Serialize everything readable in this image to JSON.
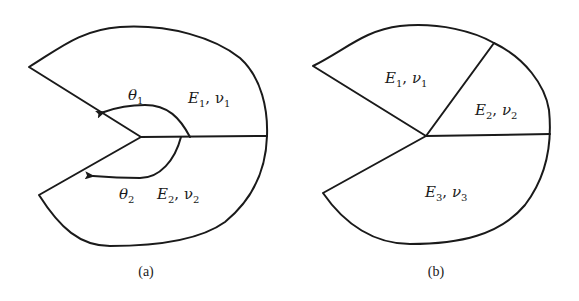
{
  "figure_a": {
    "caption": "(a)",
    "region_top": {
      "E": "E",
      "E_sub": "1",
      "nu": "ν",
      "nu_sub": "1"
    },
    "region_bottom": {
      "E": "E",
      "E_sub": "2",
      "nu": "ν",
      "nu_sub": "2"
    },
    "angle_top": {
      "symbol": "θ",
      "sub": "1"
    },
    "angle_bottom": {
      "symbol": "θ",
      "sub": "2"
    }
  },
  "figure_b": {
    "caption": "(b)",
    "region_1": {
      "E": "E",
      "E_sub": "1",
      "nu": "ν",
      "nu_sub": "1"
    },
    "region_2": {
      "E": "E",
      "E_sub": "2",
      "nu": "ν",
      "nu_sub": "2"
    },
    "region_3": {
      "E": "E",
      "E_sub": "3",
      "nu": "ν",
      "nu_sub": "3"
    }
  }
}
